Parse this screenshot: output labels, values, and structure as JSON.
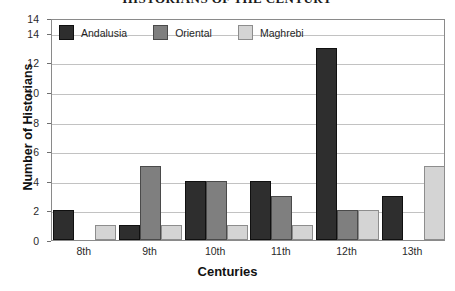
{
  "chart_data": {
    "type": "bar",
    "title": "HISTORIANS OF THE CENTURY",
    "xlabel": "Centuries",
    "ylabel": "Number of Historians",
    "categories": [
      "8th",
      "9th",
      "10th",
      "11th",
      "12th",
      "13th"
    ],
    "series": [
      {
        "name": "Andalusia",
        "color": "#2e2e2e",
        "values": [
          2,
          1,
          4,
          4,
          13,
          3
        ]
      },
      {
        "name": "Oriental",
        "color": "#7f7f7f",
        "values": [
          0,
          5,
          4,
          3,
          2,
          0
        ]
      },
      {
        "name": "Maghrebi",
        "color": "#d4d4d4",
        "values": [
          1,
          1,
          1,
          1,
          2,
          5
        ]
      }
    ],
    "ylim": [
      0,
      15
    ],
    "yticks": [
      "0",
      "2",
      "4",
      "6",
      "8",
      "10",
      "12",
      "14",
      "14"
    ],
    "ytick_values": [
      0,
      2,
      4,
      6,
      8,
      10,
      12,
      14,
      15
    ],
    "grid": true,
    "legend_position": "top-inside"
  }
}
